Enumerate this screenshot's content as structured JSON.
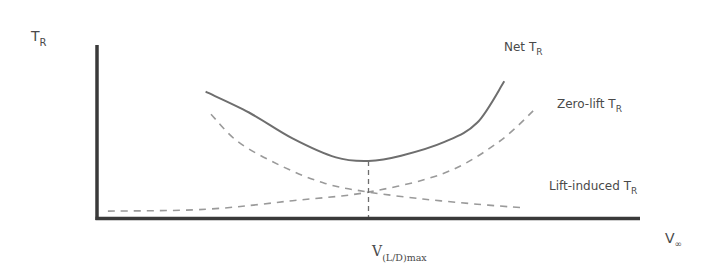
{
  "chart_data": {
    "type": "line",
    "title": "",
    "xlabel": "V∞",
    "ylabel": "T_R",
    "axis_labels": {
      "y": {
        "main": "T",
        "sub": "R"
      },
      "x": {
        "main": "V",
        "sub": "∞"
      }
    },
    "marker_label": {
      "main": "V",
      "sub": "(L/D)max"
    },
    "xlim": [
      0,
      1
    ],
    "ylim": [
      0,
      1
    ],
    "grid": false,
    "legend": "inline labels near curve ends",
    "colors": {
      "axis": "#3a3a3a",
      "net": "#6e6e6e",
      "dashed": "#9a9a9a",
      "text": "#4a4a4a"
    },
    "series": [
      {
        "name": "Net T_R",
        "label": {
          "main": "Net T",
          "sub": "R"
        },
        "style": "solid",
        "points": [
          [
            0.2,
            0.73
          ],
          [
            0.28,
            0.61
          ],
          [
            0.36,
            0.46
          ],
          [
            0.44,
            0.35
          ],
          [
            0.5,
            0.33
          ],
          [
            0.56,
            0.36
          ],
          [
            0.64,
            0.44
          ],
          [
            0.7,
            0.55
          ],
          [
            0.75,
            0.79
          ]
        ]
      },
      {
        "name": "Zero-lift T_R",
        "label": {
          "main": "Zero-lift T",
          "sub": "R"
        },
        "style": "dashed",
        "points": [
          [
            0.02,
            0.04
          ],
          [
            0.2,
            0.05
          ],
          [
            0.36,
            0.1
          ],
          [
            0.5,
            0.15
          ],
          [
            0.64,
            0.26
          ],
          [
            0.74,
            0.44
          ],
          [
            0.81,
            0.64
          ]
        ]
      },
      {
        "name": "Lift-induced T_R",
        "label": {
          "main": "Lift-induced T",
          "sub": "R"
        },
        "style": "dashed",
        "points": [
          [
            0.21,
            0.6
          ],
          [
            0.26,
            0.44
          ],
          [
            0.34,
            0.3
          ],
          [
            0.42,
            0.2
          ],
          [
            0.5,
            0.15
          ],
          [
            0.6,
            0.11
          ],
          [
            0.7,
            0.08
          ],
          [
            0.78,
            0.06
          ]
        ]
      }
    ],
    "vertical_marker": {
      "x": 0.5,
      "y_top": 0.33,
      "style": "dashed",
      "name": "V_(L/D)max"
    }
  }
}
